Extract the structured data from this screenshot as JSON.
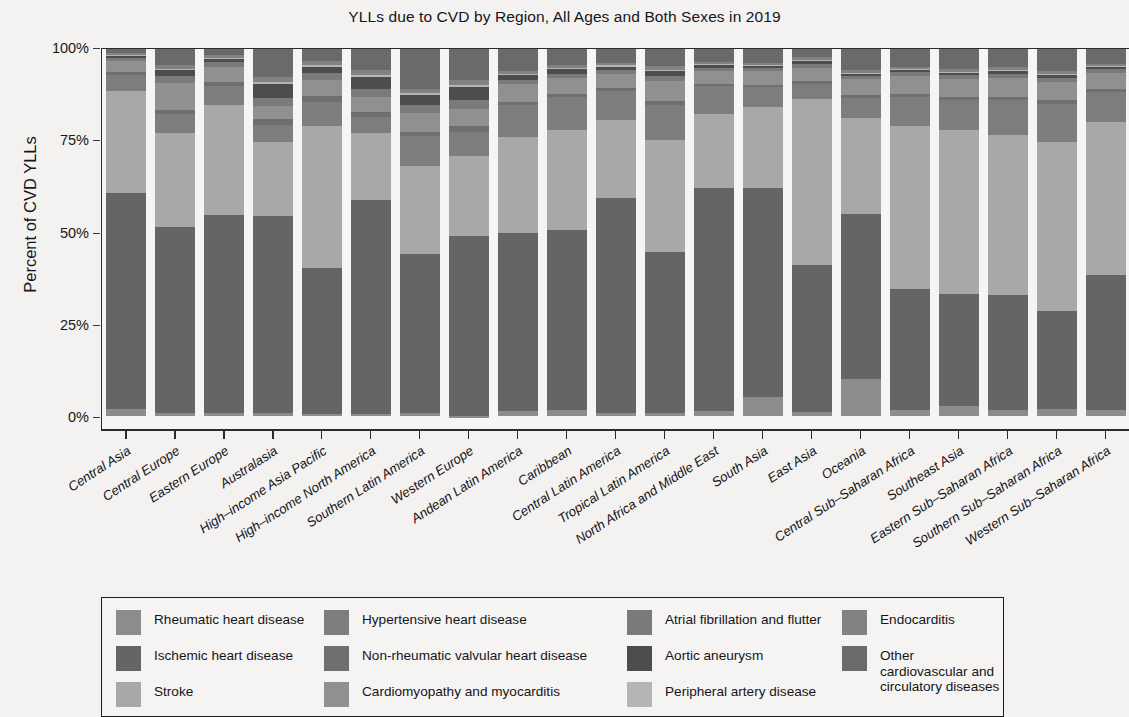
{
  "chart_data": {
    "type": "bar",
    "subtype": "stacked-percent",
    "title": "YLLs due to CVD by Region, All Ages and Both Sexes in 2019",
    "xlabel": "",
    "ylabel": "Percent of CVD YLLs",
    "ylim": [
      0,
      100
    ],
    "ytick_labels": [
      "0%",
      "25%",
      "50%",
      "75%",
      "100%"
    ],
    "ytick_values": [
      0,
      25,
      50,
      75,
      100
    ],
    "grid": false,
    "legend_position": "bottom",
    "categories": [
      "Central Asia",
      "Central Europe",
      "Eastern Europe",
      "Australasia",
      "High–income Asia Pacific",
      "High–income North America",
      "Southern Latin America",
      "Western Europe",
      "Andean Latin America",
      "Caribbean",
      "Central Latin America",
      "Tropical Latin America",
      "North Africa and Middle East",
      "South Asia",
      "East Asia",
      "Oceania",
      "Central Sub–Saharan Africa",
      "Southeast Asia",
      "Eastern Sub–Saharan Africa",
      "Southern Sub–Saharan Africa",
      "Western Sub–Saharan Africa"
    ],
    "series": [
      {
        "name": "Rheumatic heart disease",
        "color": "#8c8c8c",
        "values": [
          1.8,
          0.9,
          0.8,
          0.8,
          0.6,
          0.5,
          0.8,
          0.5,
          1.2,
          1.6,
          0.9,
          0.9,
          1.4,
          5.2,
          1.1,
          10.0,
          1.5,
          2.6,
          1.5,
          1.8,
          1.6
        ]
      },
      {
        "name": "Ischemic heart disease",
        "color": "#656565",
        "values": [
          58.7,
          50.3,
          53.6,
          53.5,
          39.5,
          58.1,
          43.0,
          49.0,
          48.5,
          48.8,
          58.2,
          43.5,
          60.4,
          56.5,
          39.8,
          44.8,
          33.0,
          30.5,
          31.2,
          26.5,
          36.6
        ]
      },
      {
        "name": "Stroke",
        "color": "#a8a8a8",
        "values": [
          27.5,
          25.5,
          30.0,
          20.0,
          38.5,
          18.0,
          24.0,
          21.5,
          26.0,
          27.0,
          21.0,
          30.5,
          20.0,
          22.0,
          45.0,
          26.0,
          44.0,
          44.5,
          43.5,
          45.8,
          41.5
        ]
      },
      {
        "name": "Hypertensive heart disease",
        "color": "#7d7d7d",
        "values": [
          4.5,
          5.0,
          5.0,
          4.5,
          6.5,
          4.5,
          8.0,
          6.5,
          8.5,
          9.0,
          8.0,
          9.5,
          7.5,
          5.5,
          4.0,
          5.5,
          8.0,
          8.0,
          9.5,
          10.5,
          8.0
        ]
      },
      {
        "name": "Non-rheumatic valvular heart disease",
        "color": "#6f6f6f",
        "values": [
          0.8,
          1.3,
          1.0,
          1.6,
          1.6,
          1.4,
          1.2,
          1.6,
          0.8,
          0.9,
          0.8,
          1.0,
          0.7,
          0.6,
          1.0,
          0.7,
          0.7,
          0.8,
          0.8,
          0.9,
          0.8
        ]
      },
      {
        "name": "Cardiomyopathy and myocarditis",
        "color": "#909090",
        "values": [
          3.0,
          7.3,
          4.2,
          3.5,
          4.3,
          4.0,
          5.2,
          4.6,
          4.9,
          4.3,
          3.7,
          5.5,
          3.4,
          3.8,
          3.4,
          4.4,
          5.0,
          4.9,
          5.2,
          5.0,
          4.5
        ]
      },
      {
        "name": "Atrial fibrillation and flutter",
        "color": "#7a7a7a",
        "values": [
          0.8,
          1.8,
          1.2,
          2.4,
          2.0,
          2.2,
          2.0,
          2.6,
          1.2,
          1.2,
          1.1,
          1.3,
          0.9,
          0.7,
          1.0,
          0.8,
          0.9,
          1.0,
          1.0,
          1.0,
          0.9
        ]
      },
      {
        "name": "Aortic aneurysm",
        "color": "#4d4d4d",
        "values": [
          0.5,
          1.6,
          0.9,
          3.6,
          1.6,
          3.3,
          2.9,
          3.4,
          1.2,
          1.2,
          1.0,
          1.4,
          0.7,
          0.5,
          0.8,
          0.6,
          0.6,
          0.7,
          0.7,
          0.8,
          0.6
        ]
      },
      {
        "name": "Peripheral artery disease",
        "color": "#b5b5b5",
        "values": [
          0.3,
          0.4,
          0.3,
          0.5,
          0.4,
          0.4,
          0.4,
          0.5,
          0.3,
          0.3,
          0.3,
          0.3,
          0.3,
          0.2,
          0.3,
          0.2,
          0.3,
          0.3,
          0.3,
          0.3,
          0.3
        ]
      },
      {
        "name": "Endocarditis",
        "color": "#828282",
        "values": [
          0.6,
          1.1,
          0.7,
          1.4,
          1.3,
          1.5,
          1.2,
          1.4,
          0.8,
          0.9,
          0.7,
          1.0,
          0.6,
          0.6,
          0.8,
          0.7,
          0.7,
          0.8,
          0.8,
          0.8,
          0.7
        ]
      },
      {
        "name": "Other cardiovascular and circulatory diseases",
        "color": "#6a6a6a",
        "values": [
          1.5,
          4.8,
          2.3,
          8.2,
          3.7,
          6.1,
          11.3,
          9.0,
          6.6,
          4.8,
          4.3,
          5.1,
          4.1,
          4.4,
          2.8,
          6.3,
          5.3,
          5.9,
          5.5,
          6.6,
          4.5
        ]
      }
    ]
  },
  "legend": {
    "columns": [
      {
        "items": [
          {
            "label": "Rheumatic heart disease",
            "color": "#8c8c8c"
          },
          {
            "label": "Ischemic heart disease",
            "color": "#656565"
          },
          {
            "label": "Stroke",
            "color": "#a8a8a8"
          }
        ]
      },
      {
        "items": [
          {
            "label": "Hypertensive heart disease",
            "color": "#7d7d7d"
          },
          {
            "label": "Non-rheumatic valvular heart disease",
            "color": "#6f6f6f"
          },
          {
            "label": "Cardiomyopathy and myocarditis",
            "color": "#909090"
          }
        ]
      },
      {
        "items": [
          {
            "label": "Atrial fibrillation and flutter",
            "color": "#7a7a7a"
          },
          {
            "label": "Aortic aneurysm",
            "color": "#4d4d4d"
          },
          {
            "label": "Peripheral artery disease",
            "color": "#b5b5b5"
          }
        ]
      },
      {
        "items": [
          {
            "label": "Endocarditis",
            "color": "#828282"
          },
          {
            "label": "Other cardiovascular and\ncirculatory diseases",
            "color": "#6a6a6a"
          }
        ]
      }
    ]
  }
}
